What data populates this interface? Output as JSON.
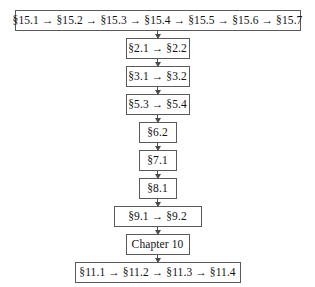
{
  "diagram": {
    "type": "flowchart",
    "orientation": "vertical",
    "title": "",
    "style": {
      "box_border_color": "#5a5a5a",
      "box_fill_color": "#ffffff",
      "connector_color": "#4a4a4a",
      "text_color": "#111111",
      "background_color": "#ffffff"
    },
    "nodes": [
      {
        "id": "node-15",
        "label": "§15.1 → §15.2 → §15.3 → §15.4 → §15.5 → §15.6 → §15.7",
        "width_class": "n-w-full"
      },
      {
        "id": "node-2",
        "label": "§2.1 → §2.2",
        "width_class": "n-w-mid"
      },
      {
        "id": "node-3",
        "label": "§3.1 → §3.2",
        "width_class": "n-w-mid"
      },
      {
        "id": "node-5",
        "label": "§5.3 → §5.4",
        "width_class": "n-w-mid"
      },
      {
        "id": "node-6",
        "label": "§6.2",
        "width_class": "n-w-small"
      },
      {
        "id": "node-7",
        "label": "§7.1",
        "width_class": "n-w-small"
      },
      {
        "id": "node-8",
        "label": "§8.1",
        "width_class": "n-w-small"
      },
      {
        "id": "node-9",
        "label": "§9.1 → §9.2",
        "width_class": "n-w-9"
      },
      {
        "id": "node-10",
        "label": "Chapter 10",
        "width_class": "n-w-ch"
      },
      {
        "id": "node-11",
        "label": "§11.1 → §11.2 → §11.3 → §11.4",
        "width_class": "n-w-11"
      }
    ],
    "edges": [
      {
        "from": "node-15",
        "to": "node-2",
        "arrow": "down"
      },
      {
        "from": "node-2",
        "to": "node-3",
        "arrow": "down"
      },
      {
        "from": "node-3",
        "to": "node-5",
        "arrow": "down"
      },
      {
        "from": "node-5",
        "to": "node-6",
        "arrow": "down"
      },
      {
        "from": "node-6",
        "to": "node-7",
        "arrow": "down"
      },
      {
        "from": "node-7",
        "to": "node-8",
        "arrow": "down"
      },
      {
        "from": "node-8",
        "to": "node-9",
        "arrow": "down"
      },
      {
        "from": "node-9",
        "to": "node-10",
        "arrow": "down"
      },
      {
        "from": "node-10",
        "to": "node-11",
        "arrow": "down"
      }
    ]
  }
}
